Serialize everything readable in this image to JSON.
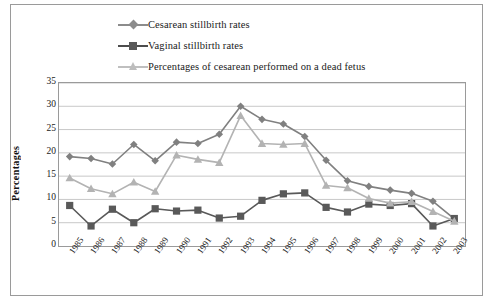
{
  "chart_data": {
    "type": "line",
    "title": "",
    "xlabel": "",
    "ylabel": "Percentages",
    "ylim": [
      0,
      35
    ],
    "ytick_step": 5,
    "yticks": [
      "35",
      "30",
      "25",
      "20",
      "15",
      "10",
      "5",
      "0"
    ],
    "grid": true,
    "legend_position": "top",
    "categories": [
      "1985",
      "1986",
      "1987",
      "1988",
      "1989",
      "1990",
      "1991",
      "1992",
      "1993",
      "1994",
      "1995",
      "1996",
      "1997",
      "1998",
      "1999",
      "2000",
      "2001",
      "2002",
      "2003"
    ],
    "series": [
      {
        "name": "Cesarean stillbirth rates",
        "marker": "diamond",
        "color": "#808080",
        "values": [
          19.2,
          18.8,
          17.6,
          21.8,
          18.3,
          22.3,
          22.0,
          24.0,
          30.0,
          27.2,
          26.2,
          23.5,
          18.4,
          14.0,
          12.8,
          12.0,
          11.3,
          9.6,
          5.8
        ]
      },
      {
        "name": "Vaginal stillbirth rates",
        "marker": "square",
        "color": "#595959",
        "values": [
          8.7,
          4.3,
          7.9,
          5.0,
          8.0,
          7.5,
          7.7,
          6.0,
          6.4,
          9.8,
          11.2,
          11.4,
          8.3,
          7.3,
          9.0,
          8.7,
          9.1,
          4.3,
          5.9
        ]
      },
      {
        "name": "Percentages of cesarean performed on a dead fetus",
        "marker": "triangle",
        "color": "#b3b3b3",
        "values": [
          14.6,
          12.3,
          11.2,
          13.7,
          11.7,
          19.5,
          18.6,
          17.9,
          28.0,
          22.0,
          21.8,
          22.0,
          13.0,
          12.5,
          10.2,
          9.2,
          9.5,
          7.4,
          5.3
        ]
      }
    ]
  },
  "legend": {
    "items": [
      {
        "label": "Cesarean stillbirth rates",
        "marker": "diamond-marker-icon",
        "color": "#808080"
      },
      {
        "label": "Vaginal stillbirth rates",
        "marker": "square-marker-icon",
        "color": "#595959"
      },
      {
        "label": "Percentages of cesarean performed on a dead fetus",
        "marker": "triangle-marker-icon",
        "color": "#b3b3b3"
      }
    ]
  },
  "axes": {
    "y_title": "Percentages"
  }
}
